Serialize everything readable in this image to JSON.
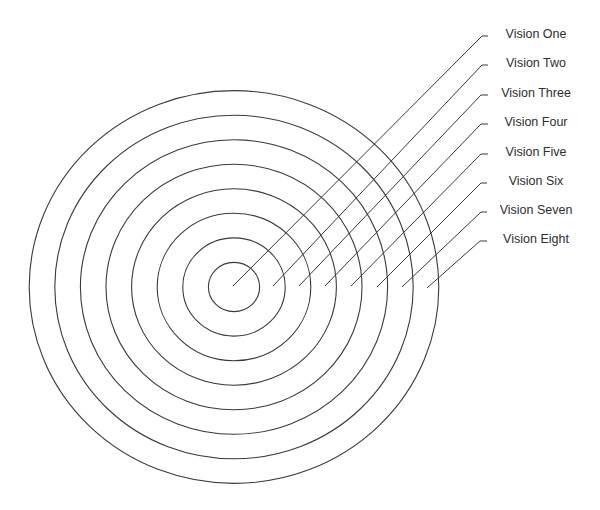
{
  "diagram": {
    "type": "concentric-target",
    "center": {
      "x": 234,
      "y": 287
    },
    "ring_step": {
      "rx": 25.6,
      "ry": 24.55
    },
    "stroke_color": "#3a3a3a",
    "text_color": "#2e2e2e",
    "label_center_x": 536,
    "rings": [
      {
        "level": 1,
        "label": "Vision One",
        "leader_end": {
          "x": 233,
          "y": 286
        },
        "leader_top": {
          "x": 482,
          "y": 36
        },
        "tick_end_x": 488
      },
      {
        "level": 2,
        "label": "Vision Two",
        "leader_end": {
          "x": 273,
          "y": 286
        },
        "leader_top": {
          "x": 482,
          "y": 65
        },
        "tick_end_x": 488
      },
      {
        "level": 3,
        "label": "Vision Three",
        "leader_end": {
          "x": 299,
          "y": 286
        },
        "leader_top": {
          "x": 481,
          "y": 95
        },
        "tick_end_x": 488
      },
      {
        "level": 4,
        "label": "Vision Four",
        "leader_end": {
          "x": 325,
          "y": 286
        },
        "leader_top": {
          "x": 481,
          "y": 124
        },
        "tick_end_x": 488
      },
      {
        "level": 5,
        "label": "Vision Five",
        "leader_end": {
          "x": 351,
          "y": 286
        },
        "leader_top": {
          "x": 481,
          "y": 154
        },
        "tick_end_x": 488
      },
      {
        "level": 6,
        "label": "Vision Six",
        "leader_end": {
          "x": 377,
          "y": 287
        },
        "leader_top": {
          "x": 481,
          "y": 183
        },
        "tick_end_x": 487
      },
      {
        "level": 7,
        "label": "Vision Seven",
        "leader_end": {
          "x": 402,
          "y": 287
        },
        "leader_top": {
          "x": 481,
          "y": 212
        },
        "tick_end_x": 487
      },
      {
        "level": 8,
        "label": "Vision Eight",
        "leader_end": {
          "x": 427,
          "y": 288
        },
        "leader_top": {
          "x": 480,
          "y": 241
        },
        "tick_end_x": 487
      }
    ]
  }
}
